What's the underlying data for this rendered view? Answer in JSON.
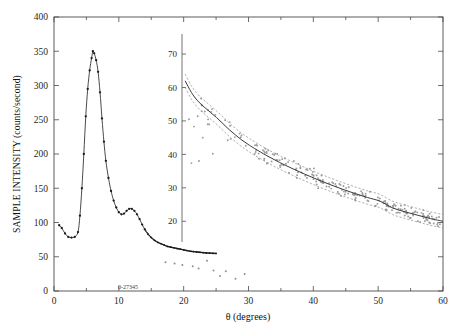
{
  "figure": {
    "plate_label": "0-27345",
    "background_color": "#ffffff",
    "curve_color": "#2b2b2b",
    "point_color": "#9a9a9a",
    "band_color": "#8c8c8c"
  },
  "chart_data": {
    "type": "line",
    "title": "",
    "subtitle": "",
    "xlabel": "θ (degrees)",
    "ylabel": "SAMPLE INTENSITY (counts/second)",
    "xlim": [
      0,
      60
    ],
    "ylim": [
      0,
      400
    ],
    "grid": false,
    "legend_position": "none",
    "x_ticks_major": [
      0,
      10,
      20,
      30,
      40,
      50,
      60
    ],
    "x_ticks_minor": [
      5,
      15,
      25,
      35,
      45,
      55
    ],
    "y_ticks_major": [
      0,
      50,
      100,
      150,
      200,
      250,
      300,
      350,
      400
    ],
    "x_tick_labels": [
      "0",
      "10",
      "20",
      "30",
      "40",
      "50",
      "60"
    ],
    "y_tick_labels": [
      "0",
      "50",
      "100",
      "150",
      "200",
      "250",
      "300",
      "350",
      "400"
    ],
    "annotations": [
      {
        "text": "0-27345",
        "x": 11.0,
        "y": 8,
        "note": "plate catalog number near x axis"
      }
    ],
    "series": [
      {
        "name": "sample intensity scan",
        "style": "line-with-dot-markers",
        "x": [
          0.8,
          1.2,
          1.7,
          2.2,
          2.7,
          3.2,
          3.7,
          4.0,
          4.3,
          4.6,
          4.9,
          5.2,
          5.5,
          5.8,
          6.0,
          6.2,
          6.5,
          6.8,
          7.1,
          7.4,
          7.7,
          8.0,
          8.4,
          8.8,
          9.2,
          9.6,
          10.0,
          10.4,
          10.8,
          11.2,
          11.6,
          12.0,
          12.4,
          12.8,
          13.2,
          13.6,
          14.0,
          14.5,
          15.0,
          15.5,
          16.0,
          16.5,
          17.0,
          17.5,
          18.0,
          18.5,
          19.0,
          19.5,
          20.0,
          20.5,
          21.0,
          21.5,
          22.0,
          22.5,
          23.0,
          23.5,
          24.0,
          24.5,
          25.0
        ],
        "y": [
          96,
          92,
          84,
          79,
          78,
          79,
          86,
          110,
          150,
          200,
          255,
          295,
          322,
          340,
          350,
          347,
          337,
          320,
          290,
          252,
          218,
          190,
          165,
          146,
          132,
          122,
          115,
          112,
          113,
          117,
          120,
          120,
          117,
          112,
          105,
          97,
          90,
          83,
          78,
          74,
          71,
          69,
          67,
          65,
          64,
          63,
          62,
          61,
          60,
          59,
          58,
          57.5,
          57,
          56.5,
          56,
          55.6,
          55.3,
          55,
          54.8
        ]
      },
      {
        "name": "stray detector points",
        "style": "scatter-sparse",
        "x": [
          17.2,
          18.6,
          19.8,
          21.4,
          22.3,
          23.6,
          24.6,
          25.6,
          26.5,
          28.0,
          29.4
        ],
        "y": [
          42,
          40,
          38,
          36,
          33,
          44,
          30,
          22,
          29,
          18,
          25
        ]
      }
    ],
    "inset": {
      "type": "scatter-with-fit",
      "xlabel": "",
      "ylabel": "",
      "xlim": [
        18.5,
        60
      ],
      "ylim": [
        15,
        73
      ],
      "y_ticks_major": [
        20,
        30,
        40,
        50,
        60,
        70
      ],
      "y_tick_labels": [
        "20",
        "30",
        "40",
        "50",
        "60",
        "70"
      ],
      "description": "Zoomed tail region: gray scatter with solid fitted decay curve and dashed confidence bands",
      "fit_curve": {
        "name": "fitted decay",
        "x": [
          19.0,
          20.0,
          21.0,
          22.0,
          23.0,
          24.0,
          25.0,
          26.0,
          27.0,
          28.0,
          29.0,
          30.0,
          32.0,
          34.0,
          36.0,
          38.0,
          40.0,
          42.0,
          44.0,
          46.0,
          48.0,
          50.0,
          52.0,
          54.0,
          56.0,
          58.0,
          60.0
        ],
        "y": [
          62.0,
          58.5,
          56.0,
          54.2,
          52.6,
          51.0,
          49.2,
          47.4,
          45.8,
          44.3,
          43.0,
          41.8,
          39.6,
          37.6,
          35.8,
          34.1,
          32.5,
          31.0,
          29.6,
          28.3,
          27.1,
          26.0,
          24.0,
          22.8,
          21.8,
          20.8,
          20.0
        ]
      },
      "band_upper_offset": 2.0,
      "band_lower_offset": 2.0,
      "scatter_count_approx": 220,
      "scatter_spread": 3.5
    }
  }
}
